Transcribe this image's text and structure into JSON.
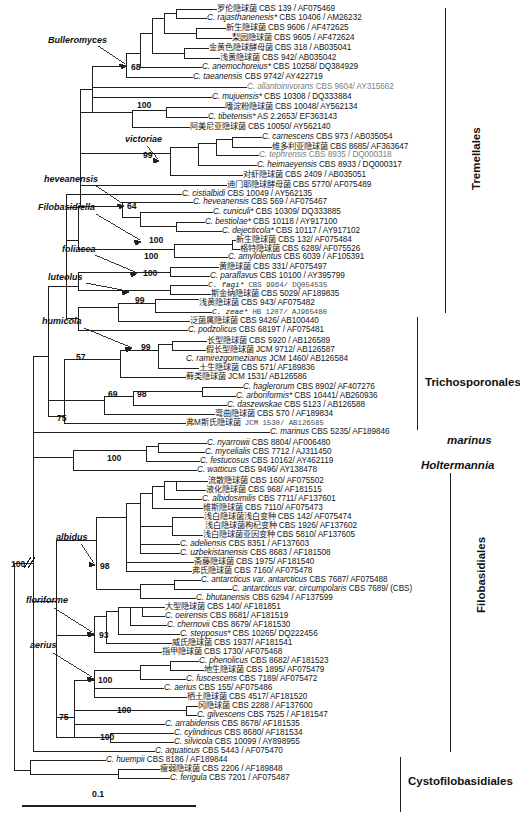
{
  "figure": {
    "type": "phylogenetic-tree",
    "scale_bar_label": "0.1",
    "root_marker": "//"
  },
  "clade_labels": [
    {
      "name": "Bulleromyces",
      "x": 48,
      "y": 41
    },
    {
      "name": "victoriae",
      "x": 125,
      "y": 140
    },
    {
      "name": "heveanensis",
      "x": 44,
      "y": 180
    },
    {
      "name": "Filobasidiella",
      "x": 38,
      "y": 208
    },
    {
      "name": "foliacea",
      "x": 62,
      "y": 250
    },
    {
      "name": "luteolus",
      "x": 48,
      "y": 278
    },
    {
      "name": "humicola",
      "x": 42,
      "y": 322
    },
    {
      "name": "albidus",
      "x": 56,
      "y": 538
    },
    {
      "name": "floriforme",
      "x": 26,
      "y": 601
    },
    {
      "name": "aerius",
      "x": 30,
      "y": 646
    }
  ],
  "order_labels": [
    {
      "name": "Tremellales",
      "italic": false,
      "x": 470,
      "y": 190,
      "vertical": true,
      "bracket": {
        "x": 445,
        "y1": 8,
        "y2": 313
      }
    },
    {
      "name": "Trichosporonales",
      "italic": false,
      "x": 425,
      "y": 376,
      "vertical": false,
      "bracket": {
        "x": 417,
        "y1": 317,
        "y2": 430
      }
    },
    {
      "name": "marinus",
      "italic": true,
      "x": 447,
      "y": 434,
      "vertical": false,
      "bracket": null
    },
    {
      "name": "Holtermannia",
      "italic": true,
      "x": 421,
      "y": 459,
      "vertical": false,
      "bracket": null
    },
    {
      "name": "Filobasidiales",
      "italic": false,
      "x": 475,
      "y": 613,
      "vertical": true,
      "bracket": {
        "x": 450,
        "y1": 473,
        "y2": 752
      }
    },
    {
      "name": "Cystofilobasidiales",
      "italic": false,
      "x": 408,
      "y": 775,
      "vertical": false,
      "bracket": {
        "x": 400,
        "y1": 757,
        "y2": 812
      }
    }
  ],
  "bootstraps": [
    {
      "value": "68",
      "x": 131,
      "y": 67
    },
    {
      "value": "100",
      "x": 137,
      "y": 105
    },
    {
      "value": "99",
      "x": 143,
      "y": 155
    },
    {
      "value": "64",
      "x": 127,
      "y": 206
    },
    {
      "value": "100",
      "x": 149,
      "y": 240
    },
    {
      "value": "100",
      "x": 144,
      "y": 256
    },
    {
      "value": "100",
      "x": 143,
      "y": 273
    },
    {
      "value": "99",
      "x": 135,
      "y": 300
    },
    {
      "value": "99",
      "x": 141,
      "y": 347
    },
    {
      "value": "57",
      "x": 76,
      "y": 357
    },
    {
      "value": "69",
      "x": 108,
      "y": 394
    },
    {
      "value": "98",
      "x": 137,
      "y": 394
    },
    {
      "value": "75",
      "x": 57,
      "y": 418
    },
    {
      "value": "100",
      "x": 107,
      "y": 458
    },
    {
      "value": "100",
      "x": 11,
      "y": 564
    },
    {
      "value": "98",
      "x": 100,
      "y": 566
    },
    {
      "value": "93",
      "x": 99,
      "y": 635
    },
    {
      "value": "100",
      "x": 98,
      "y": 680
    },
    {
      "value": "100",
      "x": 117,
      "y": 710
    },
    {
      "value": "75",
      "x": 59,
      "y": 717
    },
    {
      "value": "100",
      "x": 100,
      "y": 737
    }
  ],
  "taxa": [
    {
      "y": 9,
      "x": 217,
      "cn": "罗伦隐球菌",
      "sp": "",
      "acc": " CBS 139  / AF075469"
    },
    {
      "y": 18,
      "x": 207,
      "cn": "",
      "sp": "C. rajasthanenesis*",
      "acc": " CBS 10406  / AM26232"
    },
    {
      "y": 28,
      "x": 226,
      "cn": "新生隐球菌",
      "sp": "",
      "acc": " CBS 9606 / AF472625"
    },
    {
      "y": 38,
      "x": 232,
      "cn": "梨园隐球菌",
      "sp": "",
      "acc": " CBS 9605 / AF472624"
    },
    {
      "y": 48,
      "x": 209,
      "cn": "金黄色隐球酵母菌",
      "sp": "",
      "acc": " CBS 318 / AB035041"
    },
    {
      "y": 58,
      "x": 220,
      "cn": "浅黄隐球菌",
      "sp": "",
      "acc": " CBS 942/ AB035042"
    },
    {
      "y": 67,
      "x": 202,
      "cn": "",
      "sp": "C. anemochoreius*",
      "acc": " CBS 10258/ DQ384929"
    },
    {
      "y": 77,
      "x": 193,
      "cn": "",
      "sp": "C. taeanensis",
      "acc": "  CBS 9742/ AY422719"
    },
    {
      "y": 87,
      "x": 247,
      "cn": "",
      "sp": "C. allantoinivorans",
      "acc": " CBS 9604/ AY315662",
      "faint": true
    },
    {
      "y": 97,
      "x": 212,
      "cn": "",
      "sp": "C. mujuensis*",
      "acc": "  CBS 10308 / DQ333884"
    },
    {
      "y": 107,
      "x": 225,
      "cn": "嗜淀粉隐球菌",
      "sp": "",
      "acc": " CBS 10048/ AY562134"
    },
    {
      "y": 117,
      "x": 208,
      "cn": "",
      "sp": "C. tibetensis*",
      "acc": " AS 2.2653/ EF363143"
    },
    {
      "y": 127,
      "x": 190,
      "cn": "阿美尼亚隐球菌",
      "sp": "",
      "acc": " CBS 10050/ AY562140"
    },
    {
      "y": 137,
      "x": 262,
      "cn": "",
      "sp": "C. carnescens",
      "acc": " CBS 973 / AB035054"
    },
    {
      "y": 147,
      "x": 272,
      "cn": "维多利亚隐球菌",
      "sp": "",
      "acc": "  CBS 8685/ AF363647"
    },
    {
      "y": 155,
      "x": 259,
      "cn": "",
      "sp": "C. tephrensis",
      "acc": " CBS 8935 / DQ000318",
      "faint": true
    },
    {
      "y": 165,
      "x": 257,
      "cn": "",
      "sp": "C. heimaeyensis",
      "acc": " CBS 8933 / DQ000317"
    },
    {
      "y": 175,
      "x": 243,
      "cn": "对虾隐球菌",
      "sp": "",
      "acc": " CBS 2409 / AB035051"
    },
    {
      "y": 185,
      "x": 227,
      "cn": "迪门耶隐球酵母菌",
      "sp": "",
      "acc": " CBS 5770/ AF075489"
    },
    {
      "y": 194,
      "x": 182,
      "cn": "",
      "sp": "C. cistialbidi",
      "acc": " CBS 10049 / AY562135"
    },
    {
      "y": 202,
      "x": 193,
      "cn": "",
      "sp": "C. heveanensis",
      "acc": " CBS 569 / AF075467"
    },
    {
      "y": 212,
      "x": 213,
      "cn": "",
      "sp": "C. cuniculi*",
      "acc": "  CBS 10309/ DQ333885"
    },
    {
      "y": 222,
      "x": 205,
      "cn": "",
      "sp": "C. bestiolae*",
      "acc": " CBS 10118 / AY917100"
    },
    {
      "y": 231,
      "x": 222,
      "cn": "",
      "sp": "C. dejecticola*",
      "acc": " CBS 10117 / AY917102"
    },
    {
      "y": 240,
      "x": 236,
      "cn": "新生隐球菌",
      "sp": "",
      "acc": "  CBS 132/ AF075484"
    },
    {
      "y": 249,
      "x": 240,
      "cn": "格特隐球菌",
      "sp": "",
      "acc": " CBS 6289/ AF075526"
    },
    {
      "y": 257,
      "x": 228,
      "cn": "",
      "sp": "C. amylolentus",
      "acc": " CBS 6039 / AF105391"
    },
    {
      "y": 267,
      "x": 219,
      "cn": "黄隐球菌",
      "sp": "",
      "acc": " CBS 331/ AF075497"
    },
    {
      "y": 276,
      "x": 210,
      "cn": "",
      "sp": "C. paraflavus",
      "acc": " CBS 10100 / AY395799"
    },
    {
      "y": 285,
      "x": 208,
      "cn": "",
      "sp": "C. fagi*",
      "acc": "  CBS 9964/ DQ054535",
      "mono": true
    },
    {
      "y": 294,
      "x": 211,
      "cn": "斯金纳隐球菌",
      "sp": "",
      "acc": " CBS 5029/ AF189835"
    },
    {
      "y": 303,
      "x": 199,
      "cn": "浅黄隐球菌",
      "sp": "",
      "acc": " CBS 943/ AF075482"
    },
    {
      "y": 312,
      "x": 212,
      "cn": "",
      "sp": "C. zeae*",
      "acc": " HB 1207/ AJ965480",
      "mono": true
    },
    {
      "y": 321,
      "x": 190,
      "cn": "泛菌属隐球菌",
      "sp": "",
      "acc": " CBS 9426/ AB100440"
    },
    {
      "y": 330,
      "x": 188,
      "cn": "",
      "sp": "C. podzolicus",
      "acc": "  CBS 6819T / AF075481"
    },
    {
      "y": 341,
      "x": 207,
      "cn": "长型隐球菌",
      "sp": "",
      "acc": " CBS 5920 / AB126589"
    },
    {
      "y": 350,
      "x": 206,
      "cn": "假长型隐球菌",
      "sp": "",
      "acc": " JCM 9712/ AB126587"
    },
    {
      "y": 359,
      "x": 186,
      "cn": "",
      "sp": "C. ramirezgomezianus",
      "acc": "  JCM 1460/ AB126584"
    },
    {
      "y": 368,
      "x": 199,
      "cn": "土生隐球菌",
      "sp": "",
      "acc": "  CBS 571/ AF189836"
    },
    {
      "y": 377,
      "x": 186,
      "cn": "藓类隐球菌",
      "sp": "",
      "acc": "  JCM 1531/ AB126586"
    },
    {
      "y": 387,
      "x": 243,
      "cn": "",
      "sp": "C. haglerorum",
      "acc": " CBS 8902/ AF407276"
    },
    {
      "y": 396,
      "x": 236,
      "cn": "",
      "sp": "C. arboriformis*",
      "acc": " CBS 10441/ AB260936"
    },
    {
      "y": 405,
      "x": 227,
      "cn": "",
      "sp": "C. daszewskae",
      "acc": " CBS 5123 / AB126588"
    },
    {
      "y": 414,
      "x": 215,
      "cn": "弯曲隐球菌",
      "sp": "",
      "acc": "  CBS 570 / AF189834"
    },
    {
      "y": 423,
      "x": 186,
      "cn": "弗M斯氏隐球菌",
      "sp": "",
      "acc": "  JCM 1530/  AB126585",
      "mono": true
    },
    {
      "y": 432,
      "x": 270,
      "cn": "",
      "sp": "C. marinus",
      "acc": " CBS 5235/ AF189846"
    },
    {
      "y": 443,
      "x": 207,
      "cn": "",
      "sp": "C. nyarrowii",
      "acc": " CBS 8804/ AF006480"
    },
    {
      "y": 452,
      "x": 205,
      "cn": "",
      "sp": "C. mycelialis",
      "acc": " CBS 7712 / AJ311450"
    },
    {
      "y": 461,
      "x": 200,
      "cn": "",
      "sp": "C. festucosus",
      "acc": "  CBS 10162/ AY462119"
    },
    {
      "y": 470,
      "x": 197,
      "cn": "",
      "sp": "C. watticus",
      "acc": " CBS 9496/ AY138478"
    },
    {
      "y": 481,
      "x": 208,
      "cn": "流散隐球菌",
      "sp": "",
      "acc": "  CBS 160/ AF075502"
    },
    {
      "y": 490,
      "x": 206,
      "cn": "液化隐球菌",
      "sp": "",
      "acc": "  CBS 968/ AF181515"
    },
    {
      "y": 499,
      "x": 202,
      "cn": "",
      "sp": "C. albidosimilis",
      "acc": " CBS 7711/ AF137601"
    },
    {
      "y": 508,
      "x": 203,
      "cn": "维斯隐球菌",
      "sp": "",
      "acc": " CBS 7110/ AF075473"
    },
    {
      "y": 517,
      "x": 204,
      "cn": "浅白隐球菌浅白变种",
      "sp": "",
      "acc": "  CBS 142/ AF075474"
    },
    {
      "y": 526,
      "x": 205,
      "cn": "浅白隐球菌枸杞变种",
      "sp": "",
      "acc": "  CBS 1926/ AF137602"
    },
    {
      "y": 535,
      "x": 203,
      "cn": "浅白隐球菌亚因变种",
      "sp": "",
      "acc": " CBS 5810/ AF137605"
    },
    {
      "y": 544,
      "x": 180,
      "cn": "",
      "sp": "C. adeliensis",
      "acc": " CBS 8351 / AF137603"
    },
    {
      "y": 553,
      "x": 180,
      "cn": "",
      "sp": "C. uzbekistanensis",
      "acc": " CBS 8683 / AF181508"
    },
    {
      "y": 562,
      "x": 194,
      "cn": "斋藤隐球菌",
      "sp": "",
      "acc": "  CBS 1975/ AF181540"
    },
    {
      "y": 571,
      "x": 192,
      "cn": "弗氏隐球菌",
      "sp": "",
      "acc": " CBS 7160/ AF075478"
    },
    {
      "y": 580,
      "x": 201,
      "cn": "",
      "sp": "C. antarcticus  var. antarcticus",
      "acc": "  CBS 7687/ AF075488"
    },
    {
      "y": 589,
      "x": 232,
      "cn": "",
      "sp": "C. antarcticus  var. circumpolaris",
      "acc": " CBS 7689/ (CBS)"
    },
    {
      "y": 598,
      "x": 196,
      "cn": "",
      "sp": "C. bhutanensis",
      "acc": " CBS 6294 / AF137599"
    },
    {
      "y": 607,
      "x": 165,
      "cn": "大型隐球菌",
      "sp": "",
      "acc": "  CBS 140/ AF181851"
    },
    {
      "y": 616,
      "x": 165,
      "cn": "",
      "sp": "C. oeirensis",
      "acc": "  CBS 8681/ AF181519"
    },
    {
      "y": 625,
      "x": 167,
      "cn": "",
      "sp": "C. chernovii",
      "acc": "  CBS 8679/ AF181530"
    },
    {
      "y": 634,
      "x": 180,
      "cn": "",
      "sp": "C. stepposus*",
      "acc": "  CBS 10265/ DQ222456"
    },
    {
      "y": 643,
      "x": 172,
      "cn": "威氏隐球菌",
      "sp": "",
      "acc": "  CBS 1937/ AF181541"
    },
    {
      "y": 652,
      "x": 162,
      "cn": "指甲隐球菌",
      "sp": "",
      "acc": " CBS 1730/ AF075468"
    },
    {
      "y": 661,
      "x": 199,
      "cn": "",
      "sp": "C. phenolicus",
      "acc": "  CBS 8682/ AF181523"
    },
    {
      "y": 670,
      "x": 204,
      "cn": "地生隐球菌",
      "sp": "",
      "acc": "  CBS 1895/ AF075479"
    },
    {
      "y": 679,
      "x": 186,
      "cn": "",
      "sp": "C. fuscescens",
      "acc": "  CBS 7189/ AF075472"
    },
    {
      "y": 688,
      "x": 164,
      "cn": "",
      "sp": "C. aerius",
      "acc": "  CBS 155/ AF075486"
    },
    {
      "y": 697,
      "x": 187,
      "cn": "栖土隐球菌",
      "sp": "",
      "acc": "  CBS 4517/ AF181520"
    },
    {
      "y": 706,
      "x": 198,
      "cn": "冈隐球菌",
      "sp": "",
      "acc": "  CBS 2288 / AF137600"
    },
    {
      "y": 715,
      "x": 197,
      "cn": "",
      "sp": "C. gilvescens",
      "acc": "   CBS 7525 / AF181547"
    },
    {
      "y": 724,
      "x": 165,
      "cn": "",
      "sp": "C. arrabidensis",
      "acc": "  CBS 8678/ AF181535"
    },
    {
      "y": 733,
      "x": 174,
      "cn": "",
      "sp": "C. cylindricus",
      "acc": "  CBS 8680/ AF181534"
    },
    {
      "y": 742,
      "x": 174,
      "cn": "",
      "sp": "C. silvicola",
      "acc": "  CBS 10099 / AY898955"
    },
    {
      "y": 751,
      "x": 155,
      "cn": "",
      "sp": "C. aquaticus",
      "acc": "  CBS 5443 / AF075470"
    },
    {
      "y": 760,
      "x": 106,
      "cn": "",
      "sp": "C. huempii",
      "acc": " CBS 8186 / AF189844"
    },
    {
      "y": 769,
      "x": 160,
      "cn": "瘦弱隐球菌",
      "sp": "",
      "acc": " CBS 2206 / AF189848"
    },
    {
      "y": 778,
      "x": 170,
      "cn": "",
      "sp": "C. ferigula",
      "acc": " CBS 7201 / AF075487"
    }
  ]
}
